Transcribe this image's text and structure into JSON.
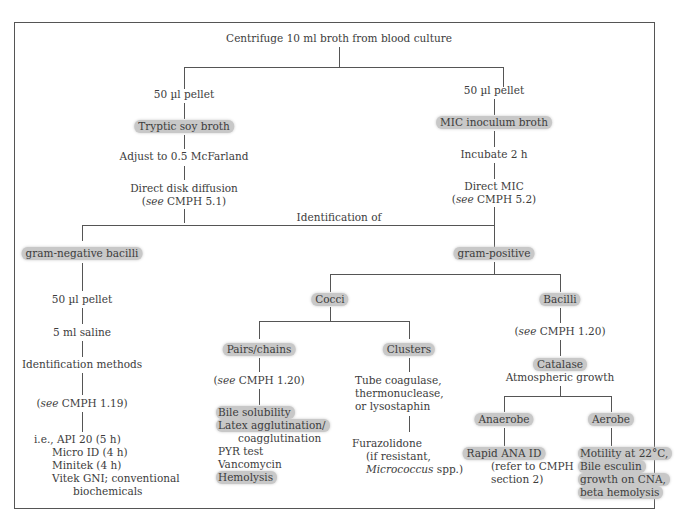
{
  "root": "Centrifuge 10 ml broth from blood culture",
  "left_branch": {
    "pellet": "50 µl pellet",
    "broth": "Tryptic soy broth",
    "adjust": "Adjust to 0.5 McFarland",
    "test": "Direct disk diffusion",
    "ref_pre": "(",
    "ref_see": "see",
    "ref_post": " CMPH 5.1)"
  },
  "right_branch": {
    "pellet": "50 µl pellet",
    "broth": "MIC inoculum broth",
    "incubate": "Incubate 2 h",
    "test": "Direct MIC",
    "ref_pre": "(",
    "ref_see": "see",
    "ref_post": " CMPH 5.2)"
  },
  "identification_label": "Identification of",
  "gram_negative": {
    "title": "gram-negative bacilli",
    "pellet": "50 µl pellet",
    "saline": "5 ml saline",
    "methods": "Identification methods",
    "ref_pre": "(",
    "ref_see": "see",
    "ref_post": " CMPH 1.19)",
    "list": [
      "i.e., API 20 (5 h)",
      "Micro ID (4 h)",
      "Minitek (4 h)",
      "Vitek GNI; conventional",
      "biochemicals"
    ]
  },
  "gram_positive": {
    "title": "gram-positive",
    "cocci": {
      "title": "Cocci",
      "pairs": {
        "title": "Pairs/chains",
        "ref_pre": "(",
        "ref_see": "see",
        "ref_post": " CMPH 1.20)",
        "tests": [
          "Bile solubility",
          "Latex agglutination/",
          "coagglutination",
          "PYR test",
          "Vancomycin",
          "Hemolysis"
        ]
      },
      "clusters": {
        "title": "Clusters",
        "tests": [
          "Tube coagulase,",
          "thermonuclease,",
          "or lysostaphin"
        ],
        "furazolidone": "Furazolidone",
        "note1": "(if resistant,",
        "note2_italic": "Micrococcus",
        "note2_rest": " spp.)"
      }
    },
    "bacilli": {
      "title": "Bacilli",
      "ref_pre": "(",
      "ref_see": "see",
      "ref_post": " CMPH 1.20)",
      "catalase": "Catalase",
      "atmospheric": "Atmospheric growth",
      "anaerobe": {
        "title": "Anaerobe",
        "test": "Rapid ANA ID",
        "note1": "(refer to CMPH",
        "note2": "section 2)"
      },
      "aerobe": {
        "title": "Aerobe",
        "tests": [
          "Motility at 22°C,",
          "Bile esculin",
          "growth on CNA,",
          "beta hemolysis"
        ]
      }
    }
  },
  "colors": {
    "highlight": "#c8c8c8",
    "line": "#555555",
    "text": "#3c3c3c"
  }
}
